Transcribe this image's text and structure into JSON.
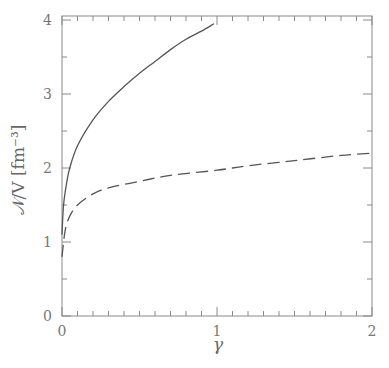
{
  "chart_data": {
    "type": "line",
    "title": "",
    "xlabel": "γ",
    "ylabel": "𝒩/V [fm⁻³]",
    "xlim": [
      0,
      2
    ],
    "ylim": [
      0,
      4.1
    ],
    "x_ticks": [
      "0",
      "1",
      "2"
    ],
    "y_ticks": [
      "0",
      "1",
      "2",
      "3",
      "4"
    ],
    "x_minor_step": 0.1,
    "y_minor_step": 0.5,
    "grid": false,
    "legend": null,
    "series": [
      {
        "name": "solid",
        "style": "solid",
        "x": [
          0.0,
          0.01,
          0.03,
          0.05,
          0.1,
          0.2,
          0.3,
          0.4,
          0.5,
          0.6,
          0.7,
          0.8,
          0.9,
          0.98
        ],
        "y": [
          1.1,
          1.5,
          1.8,
          2.0,
          2.3,
          2.65,
          2.9,
          3.1,
          3.28,
          3.44,
          3.6,
          3.74,
          3.85,
          3.95
        ]
      },
      {
        "name": "dashed",
        "style": "dashed",
        "x": [
          0.0,
          0.02,
          0.05,
          0.1,
          0.2,
          0.3,
          0.5,
          0.7,
          1.0,
          1.2,
          1.5,
          1.8,
          2.0
        ],
        "y": [
          0.8,
          1.15,
          1.35,
          1.5,
          1.65,
          1.73,
          1.82,
          1.9,
          1.97,
          2.03,
          2.1,
          2.17,
          2.2
        ]
      }
    ]
  }
}
